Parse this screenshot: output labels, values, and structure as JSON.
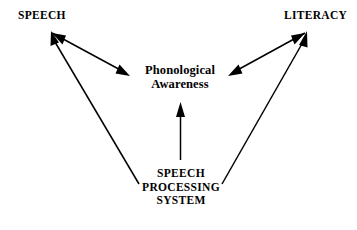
{
  "diagram": {
    "background_color": "#ffffff",
    "stroke_color": "#000000",
    "nodes": {
      "speech": {
        "label": "SPEECH"
      },
      "literacy": {
        "label": "LITERACY"
      },
      "phonological_awareness": {
        "line1": "Phonological",
        "line2": "Awareness"
      },
      "speech_processing_system": {
        "line1": "SPEECH",
        "line2": "PROCESSING",
        "line3": "SYSTEM"
      }
    },
    "connections": [
      {
        "name": "speech-phonological-awareness",
        "from": "SPEECH",
        "to": "Phonological Awareness",
        "arrowheads": "both"
      },
      {
        "name": "literacy-phonological-awareness",
        "from": "LITERACY",
        "to": "Phonological Awareness",
        "arrowheads": "both"
      },
      {
        "name": "speech-processing-system-phonological-awareness",
        "from": "SPEECH PROCESSING SYSTEM",
        "to": "Phonological Awareness",
        "arrowheads": "single"
      },
      {
        "name": "speech-processing-system-speech",
        "from": "SPEECH PROCESSING SYSTEM",
        "to": "SPEECH",
        "arrowheads": "single"
      },
      {
        "name": "speech-processing-system-literacy",
        "from": "SPEECH PROCESSING SYSTEM",
        "to": "LITERACY",
        "arrowheads": "single"
      }
    ]
  }
}
